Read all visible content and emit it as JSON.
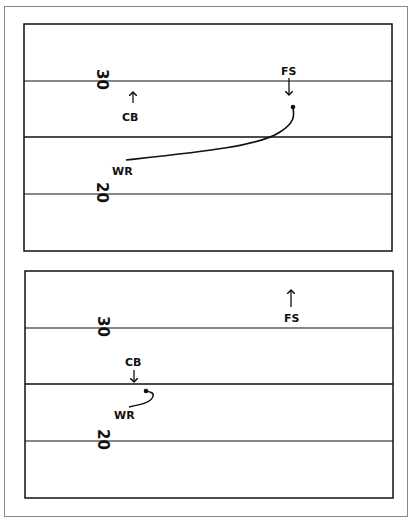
{
  "diagrams": [
    {
      "name": "before",
      "yard_top": "30",
      "yard_bottom": "20",
      "players": {
        "cb": "CB",
        "fs": "FS",
        "wr": "WR"
      }
    },
    {
      "name": "after",
      "yard_top": "30",
      "yard_bottom": "20",
      "players": {
        "cb": "CB",
        "fs": "FS",
        "wr": "WR"
      }
    }
  ],
  "colors": {
    "line": "#111111",
    "background": "#ffffff",
    "frame": "#888888"
  }
}
